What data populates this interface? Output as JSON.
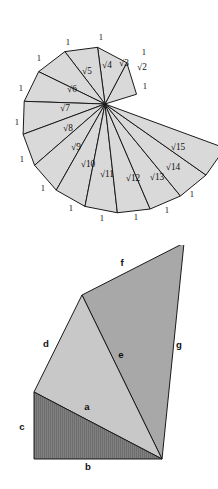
{
  "figure": {
    "background_color": "#ffffff",
    "stroke_color": "#1a1a1a",
    "panels": [
      {
        "name": "spiral-of-theodorus",
        "index": 1
      },
      {
        "name": "triangle-decomposition",
        "index": 2
      }
    ]
  },
  "spiral": {
    "name": "spiral-of-theodorus",
    "fill_color": "#d9d9d9",
    "stroke_color": "#1a1a1a",
    "center": {
      "x": 105,
      "y": 104
    },
    "initial_leg": 33,
    "hypotenuse_labels": [
      {
        "text": "√2",
        "x": 142,
        "y": 70,
        "value": 2
      },
      {
        "text": "√3",
        "x": 124,
        "y": 66,
        "value": 3
      },
      {
        "text": "√4",
        "x": 107,
        "y": 68,
        "value": 4
      },
      {
        "text": "√5",
        "x": 87,
        "y": 74,
        "value": 5
      },
      {
        "text": "√6",
        "x": 72,
        "y": 92,
        "value": 6
      },
      {
        "text": "√7",
        "x": 65,
        "y": 111,
        "value": 7
      },
      {
        "text": "√8",
        "x": 68,
        "y": 131,
        "value": 8
      },
      {
        "text": "√9",
        "x": 76,
        "y": 150,
        "value": 9
      },
      {
        "text": "√10",
        "x": 88,
        "y": 167,
        "value": 10
      },
      {
        "text": "√11",
        "x": 107,
        "y": 177,
        "value": 11
      },
      {
        "text": "√12",
        "x": 133,
        "y": 181,
        "value": 12
      },
      {
        "text": "√13",
        "x": 157,
        "y": 180,
        "value": 13
      },
      {
        "text": "√14",
        "x": 173,
        "y": 170,
        "value": 14
      },
      {
        "text": "√15",
        "x": 178,
        "y": 150,
        "value": 15
      }
    ],
    "unit_labels": [
      {
        "text": "1",
        "x": 144,
        "y": 55
      },
      {
        "text": "1",
        "x": 101,
        "y": 40
      },
      {
        "text": "1",
        "x": 68,
        "y": 45
      },
      {
        "text": "1",
        "x": 39,
        "y": 61
      },
      {
        "text": "1",
        "x": 21,
        "y": 91
      },
      {
        "text": "1",
        "x": 17,
        "y": 125
      },
      {
        "text": "1",
        "x": 22,
        "y": 162
      },
      {
        "text": "1",
        "x": 43,
        "y": 191
      },
      {
        "text": "1",
        "x": 71,
        "y": 211
      },
      {
        "text": "1",
        "x": 102,
        "y": 221
      },
      {
        "text": "1",
        "x": 136,
        "y": 220
      },
      {
        "text": "1",
        "x": 167,
        "y": 213
      },
      {
        "text": "1",
        "x": 192,
        "y": 197
      },
      {
        "text": "1",
        "x": 145,
        "y": 89
      }
    ],
    "unit_label_value": "1"
  },
  "triangles": {
    "name": "triangle-decomposition",
    "fill_dark": "#808080",
    "fill_mid": "#a8a8a8",
    "fill_light": "#c8c8c8",
    "stroke_color": "#1a1a1a",
    "vertices": {
      "left": {
        "x": 34,
        "y": 392
      },
      "apex": {
        "x": 82,
        "y": 295
      },
      "top_right": {
        "x": 184,
        "y": 243
      },
      "bottom_right": {
        "x": 162,
        "y": 459
      },
      "bottom_left": {
        "x": 34,
        "y": 459
      }
    },
    "regions": [
      {
        "name": "lower-dark-triangle",
        "shade": "dark"
      },
      {
        "name": "middle-light-triangle",
        "shade": "light"
      },
      {
        "name": "upper-mid-triangle",
        "shade": "mid"
      }
    ],
    "side_labels": [
      {
        "text": "f",
        "x": 122,
        "y": 266,
        "name": "side-label-f"
      },
      {
        "text": "d",
        "x": 46,
        "y": 347,
        "name": "side-label-d"
      },
      {
        "text": "e",
        "x": 121,
        "y": 358,
        "name": "side-label-e"
      },
      {
        "text": "g",
        "x": 179,
        "y": 348,
        "name": "side-label-g"
      },
      {
        "text": "a",
        "x": 87,
        "y": 410,
        "name": "side-label-a"
      },
      {
        "text": "c",
        "x": 22,
        "y": 430,
        "name": "side-label-c"
      },
      {
        "text": "b",
        "x": 88,
        "y": 470,
        "name": "side-label-b"
      }
    ]
  }
}
